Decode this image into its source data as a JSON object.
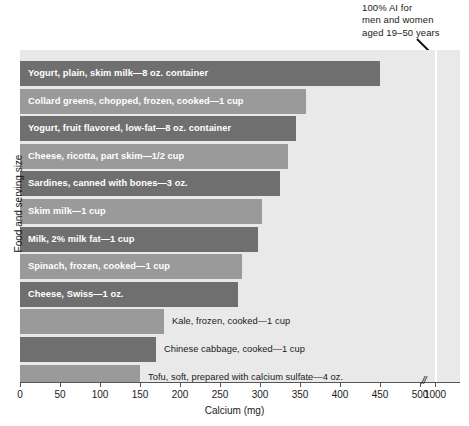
{
  "annotation": {
    "line1": "100% AI for",
    "line2": "men and women",
    "line3": "aged 19–50 years",
    "arrow_icon": "arrow-down-right-icon",
    "reference_value": 1000
  },
  "axes": {
    "x_title": "Calcium (mg)",
    "y_title": "Food and serving size",
    "x_ticks": [
      0,
      50,
      100,
      150,
      200,
      250,
      300,
      350,
      400,
      450,
      500,
      1000
    ],
    "x_tick_labels": [
      "0",
      "50",
      "100",
      "150",
      "200",
      "250",
      "300",
      "350",
      "400",
      "450",
      "500",
      "1000"
    ],
    "axis_break_between": [
      500,
      1000
    ],
    "axis_break_glyph": "//"
  },
  "colors": {
    "plot_background": "#e9e9e9",
    "bar_dark": "#6f6f6f",
    "bar_mid": "#9a9a9a",
    "reference_line": "#ffffff",
    "text_dark": "#1a1a1a",
    "text_light": "#ffffff"
  },
  "chart_data": {
    "type": "bar",
    "orientation": "horizontal",
    "title": "",
    "xlabel": "Calcium (mg)",
    "ylabel": "Food and serving size",
    "xlim": [
      0,
      1000
    ],
    "grid": false,
    "legend": "none",
    "annotations": [
      {
        "text": "100% AI for men and women aged 19–50 years",
        "value": 1000,
        "type": "reference-line"
      }
    ],
    "categories": [
      "Yogurt, plain, skim milk—8 oz. container",
      "Collard greens, chopped, frozen, cooked—1 cup",
      "Yogurt, fruit flavored, low-fat—8 oz. container",
      "Cheese, ricotta, part skim—1/2 cup",
      "Sardines, canned with bones—3 oz.",
      "Skim milk—1 cup",
      "Milk, 2% milk fat—1 cup",
      "Spinach, frozen, cooked—1 cup",
      "Cheese, Swiss—1 oz.",
      "Kale, frozen, cooked—1 cup",
      "Chinese cabbage, cooked—1 cup",
      "Tofu, soft, prepared with calcium sulfate—4 oz."
    ],
    "values": [
      450,
      357,
      345,
      335,
      325,
      302,
      297,
      277,
      272,
      180,
      170,
      150
    ]
  },
  "bars": [
    {
      "label": "Yogurt, plain, skim milk—8 oz. container",
      "value": 450,
      "shade": "dark",
      "label_position": "inside"
    },
    {
      "label": "Collard greens, chopped, frozen, cooked—1 cup",
      "value": 357,
      "shade": "mid",
      "label_position": "inside"
    },
    {
      "label": "Yogurt, fruit flavored, low-fat—8 oz. container",
      "value": 345,
      "shade": "dark",
      "label_position": "inside"
    },
    {
      "label": "Cheese, ricotta, part skim—1/2 cup",
      "value": 335,
      "shade": "mid",
      "label_position": "inside"
    },
    {
      "label": "Sardines, canned with bones—3 oz.",
      "value": 325,
      "shade": "dark",
      "label_position": "inside"
    },
    {
      "label": "Skim milk—1 cup",
      "value": 302,
      "shade": "mid",
      "label_position": "inside"
    },
    {
      "label": "Milk, 2% milk fat—1 cup",
      "value": 297,
      "shade": "dark",
      "label_position": "inside"
    },
    {
      "label": "Spinach, frozen, cooked—1 cup",
      "value": 277,
      "shade": "mid",
      "label_position": "inside"
    },
    {
      "label": "Cheese, Swiss—1 oz.",
      "value": 272,
      "shade": "dark",
      "label_position": "inside"
    },
    {
      "label": "Kale, frozen, cooked—1 cup",
      "value": 180,
      "shade": "mid",
      "label_position": "outside"
    },
    {
      "label": "Chinese cabbage, cooked—1 cup",
      "value": 170,
      "shade": "dark",
      "label_position": "outside"
    },
    {
      "label": "Tofu, soft, prepared with calcium sulfate—4 oz.",
      "value": 150,
      "shade": "mid",
      "label_position": "outside"
    }
  ]
}
